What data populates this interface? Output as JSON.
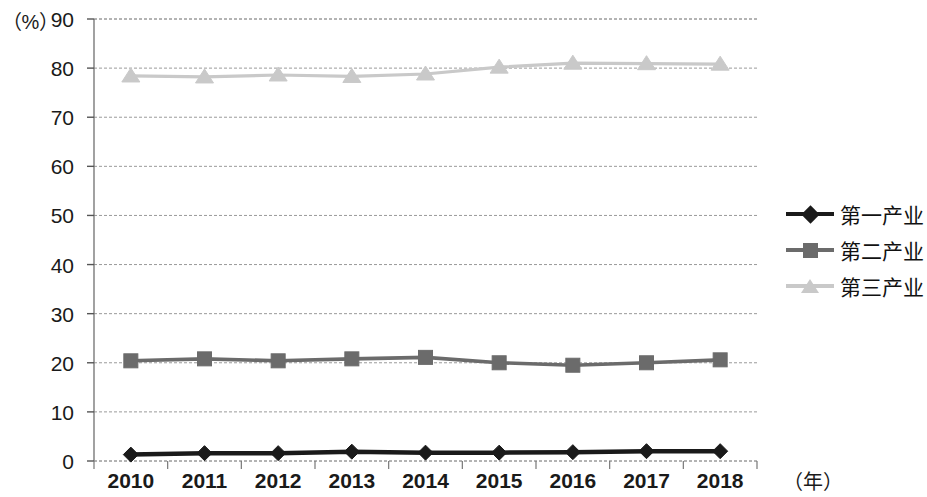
{
  "chart_data": {
    "type": "line",
    "title": "",
    "xlabel": "（年）",
    "ylabel": "（%）",
    "categories": [
      "2010",
      "2011",
      "2012",
      "2013",
      "2014",
      "2015",
      "2016",
      "2017",
      "2018"
    ],
    "ylim": [
      0,
      90
    ],
    "yticks": [
      0,
      10,
      20,
      30,
      40,
      50,
      60,
      70,
      80,
      90
    ],
    "grid": true,
    "legend_position": "right",
    "series": [
      {
        "name": "第一产业",
        "marker": "diamond",
        "color": "#1a1a1a",
        "values": [
          1.3,
          1.6,
          1.6,
          1.9,
          1.7,
          1.7,
          1.8,
          2.0,
          2.0
        ]
      },
      {
        "name": "第二产业",
        "marker": "square",
        "color": "#6b6b6b",
        "values": [
          20.4,
          20.8,
          20.4,
          20.8,
          21.1,
          20.0,
          19.5,
          20.0,
          20.6
        ]
      },
      {
        "name": "第三产业",
        "marker": "triangle",
        "color": "#c9c9c9",
        "values": [
          78.4,
          78.2,
          78.6,
          78.3,
          78.8,
          80.2,
          81.0,
          80.9,
          80.8
        ]
      }
    ]
  },
  "axes": {
    "y_unit": "（%）",
    "x_unit": "（年）",
    "y_tick_labels": [
      "90",
      "80",
      "70",
      "60",
      "50",
      "40",
      "30",
      "20",
      "10",
      "0"
    ],
    "x_tick_labels": [
      "2010",
      "2011",
      "2012",
      "2013",
      "2014",
      "2015",
      "2016",
      "2017",
      "2018"
    ]
  },
  "legend": {
    "items": [
      {
        "label": "第一产业",
        "color": "#1a1a1a",
        "marker": "diamond"
      },
      {
        "label": "第二产业",
        "color": "#6b6b6b",
        "marker": "square"
      },
      {
        "label": "第三产业",
        "color": "#c9c9c9",
        "marker": "triangle"
      }
    ]
  }
}
